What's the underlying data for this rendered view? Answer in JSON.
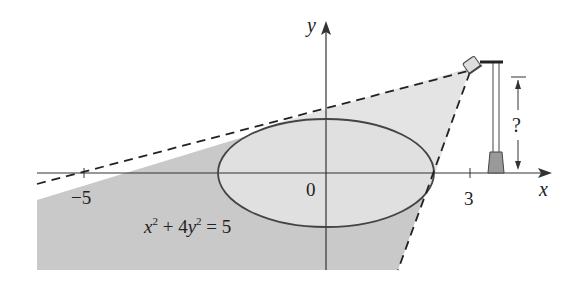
{
  "diagram": {
    "type": "math-figure",
    "axes": {
      "x_label": "x",
      "y_label": "y",
      "origin_label": "0",
      "ticks": [
        {
          "value": -5,
          "label": "−5"
        },
        {
          "value": 3,
          "label": "3"
        }
      ]
    },
    "ellipse": {
      "equation": "x² + 4y² = 5",
      "eq_x": "x",
      "eq_x_exp": "2",
      "eq_plus": " + 4",
      "eq_y": "y",
      "eq_y_exp": "2",
      "eq_rhs": " = 5",
      "semi_major": 2.236,
      "semi_minor": 1.118
    },
    "lamp": {
      "x_position": 3,
      "height_label": "?",
      "height_unknown": true
    },
    "tangent_lines": {
      "style": "dashed",
      "count": 2
    },
    "colors": {
      "shade_dark": "#c9c9c9",
      "shade_light": "#e2e2e2",
      "stroke": "#333333",
      "background": "#ffffff"
    }
  }
}
